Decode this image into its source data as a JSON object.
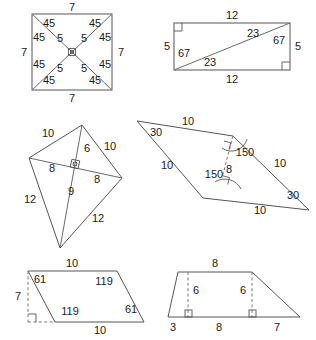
{
  "page": {
    "background_color": "#ffffff",
    "stroke_color": "#555555",
    "text_color": "#1a1a1a"
  },
  "figures": [
    {
      "id": "square-with-diagonals",
      "name": "Square with diagonals",
      "shape": "square",
      "labels": {
        "side_top": "7",
        "side_right": "7",
        "side_bottom": "7",
        "side_left": "7",
        "half_diag_tl": "5",
        "half_diag_tr": "5",
        "half_diag_bl": "5",
        "half_diag_br": "5",
        "angle_top_left_a": "45",
        "angle_top_left_b": "45",
        "angle_top_right_a": "45",
        "angle_top_right_b": "45",
        "angle_bottom_left_a": "45",
        "angle_bottom_left_b": "45",
        "angle_bottom_right_a": "45",
        "angle_bottom_right_b": "45"
      }
    },
    {
      "id": "rectangle-with-diagonal",
      "name": "Rectangle with one diagonal",
      "shape": "rectangle",
      "labels": {
        "side_top": "12",
        "side_bottom": "12",
        "side_left": "5",
        "side_right": "5",
        "angle_top_upper": "23",
        "angle_top_lower": "67",
        "angle_bottom_upper": "67",
        "angle_bottom_lower": "23"
      }
    },
    {
      "id": "kite-with-diagonals",
      "name": "Kite with diagonals",
      "shape": "kite",
      "labels": {
        "side_upper_left": "10",
        "side_upper_right": "10",
        "side_lower_left": "12",
        "side_lower_right": "12",
        "diag_upper": "6",
        "diag_lower": "9",
        "diag_left": "8",
        "diag_right": "8"
      }
    },
    {
      "id": "rhombus-with-height",
      "name": "Rhombus with height",
      "shape": "rhombus",
      "labels": {
        "side_top": "10",
        "side_right": "10",
        "side_bottom": "10",
        "side_left": "10",
        "angle_left": "30",
        "angle_right": "30",
        "angle_upper": "150",
        "angle_lower": "150",
        "height": "8"
      }
    },
    {
      "id": "parallelogram-with-height",
      "name": "Parallelogram with height",
      "shape": "parallelogram",
      "labels": {
        "side_top": "10",
        "side_bottom": "10",
        "height": "7",
        "angle_top_left": "61",
        "angle_top_right": "119",
        "angle_bottom_left": "119",
        "angle_bottom_right": "61"
      }
    },
    {
      "id": "trapezoid-with-heights",
      "name": "Trapezoid with heights",
      "shape": "trapezoid",
      "labels": {
        "side_top": "8",
        "height_left": "6",
        "height_right": "6",
        "base_left_segment": "3",
        "base_middle_segment": "8",
        "base_right_segment": "7"
      }
    }
  ]
}
